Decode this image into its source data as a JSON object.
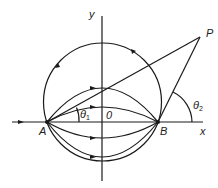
{
  "diagram": {
    "labels": {
      "y_axis": "y",
      "x_axis": "x",
      "point_a": "A",
      "point_b": "B",
      "point_p": "P",
      "origin": "0",
      "theta1": "θ",
      "theta1_sub": "1",
      "theta2": "θ",
      "theta2_sub": "2"
    },
    "colors": {
      "stroke": "#1a1a1a",
      "background": "#ffffff"
    }
  }
}
